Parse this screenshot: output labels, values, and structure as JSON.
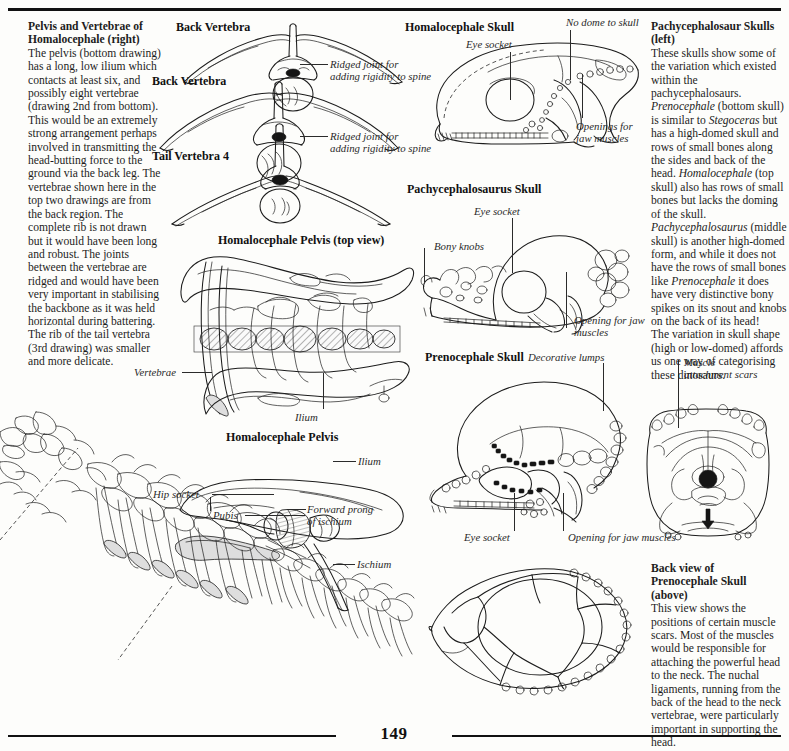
{
  "page": {
    "folio": "149",
    "accent_color": "#111111",
    "paper_color": "#fdfdfb",
    "ink_color": "#1c1c1c"
  },
  "columns": {
    "left_text": {
      "heading_line1": "Pelvis and Vertebrae of",
      "heading_line2": "Homalocephale (right)",
      "body": "The pelvis (bottom drawing) has a long, low ilium which contacts at least six, and possibly eight vertebrae (drawing 2nd from bottom). This would be an extremely strong arrangement perhaps involved in transmitting the head-butting force to the ground via the back leg. The vertebrae shown here in the top two drawings are from the back region. The complete rib is not drawn but it would have been long and robust. The joints between the vertebrae are ridged and would have been very important in stabilising the backbone as it was held horizontal during battering. The rib of the tail vertebra (3rd drawing) was smaller and more delicate."
    },
    "right_text_top": {
      "heading_line1": "Pachycephalosaur Skulls",
      "heading_line2": "(left)",
      "para1_a": "These skulls show some of the variation which existed within the pachycephalosaurs. ",
      "para1_italic1": "Prenocephale",
      "para1_b": " (bottom skull) is similar to ",
      "para1_italic2": "Stegoceras",
      "para1_c": " but has a high-domed skull and rows of small bones along the sides and back of the head. ",
      "para1_italic3": "Homalocephale",
      "para1_d": " (top skull) also has rows of small bones but lacks the doming of the skull.",
      "para2_italic1": "Pachycephalosaurus",
      "para2_a": " (middle skull) is another high-domed form, and while it does not have the rows of small bones like ",
      "para2_italic2": "Prenocephale",
      "para2_b": " it does have very distinctive bony spikes on its snout and knobs on the back of its head!",
      "para3": "The variation in skull shape (high or low-domed) affords us one way of categorising these dinosaurs."
    },
    "right_text_bottom": {
      "heading_line1": "Back view of",
      "heading_line2": "Prenocephale Skull",
      "heading_line3": "(above)",
      "body": "This view shows the positions of certain muscle scars. Most of the muscles would be responsible for attaching the powerful head to the neck. The nuchal ligaments, running from the back of the head to the neck vertebrae, were particularly important in supporting the head."
    }
  },
  "figures": {
    "back_vertebra_1": {
      "heading": "Back Vertebra",
      "callout": "Ridged joint for\nadding rigidity to spine",
      "callout_line1": "Ridged joint for",
      "callout_line2": "adding rigidity to spine"
    },
    "back_vertebra_2": {
      "heading": "Back Vertebra",
      "callout_line1": "Ridged joint for",
      "callout_line2": "adding rigidity to spine"
    },
    "tail_vertebra_4": {
      "heading": "Tail Vertebra 4"
    },
    "homalocephale_pelvis_top": {
      "heading": "Homalocephale Pelvis  (top view)",
      "label_vertebrae": "Vertebrae",
      "label_ilium": "Ilium"
    },
    "homalocephale_pelvis_side": {
      "heading": "Homalocephale Pelvis",
      "label_ilium": "Ilium",
      "label_hip_socket": "Hip socket",
      "label_pubis": "Pubis",
      "label_forward_prong_l1": "Forward prong",
      "label_forward_prong_l2": "of ischium",
      "label_ischium": "Ischium"
    },
    "homalocephale_skull": {
      "heading": "Homalocephale Skull",
      "label_eye_socket": "Eye socket",
      "label_no_dome": "No dome to skull",
      "label_openings_l1": "Openings for",
      "label_openings_l2": "jaw muscles"
    },
    "pachycephalosaurus_skull": {
      "heading": "Pachycephalosaurus Skull",
      "label_eye_socket": "Eye socket",
      "label_bony_knobs": "Bony knobs",
      "label_opening_l1": "Opening for jaw",
      "label_opening_l2": "muscles"
    },
    "prenocephale_skull": {
      "heading": "Prenocephale Skull",
      "label_decorative_lumps": "Decorative lumps",
      "label_eye_socket": "Eye socket",
      "label_opening_jaw": "Opening for jaw muscles"
    },
    "prenocephale_back_view": {
      "label_muscle_l1": "Muscle",
      "label_muscle_l2": "attachment scars"
    },
    "prenocephale_top_view": {
      "caption": ""
    },
    "skeleton_tail": {
      "caption": ""
    }
  }
}
